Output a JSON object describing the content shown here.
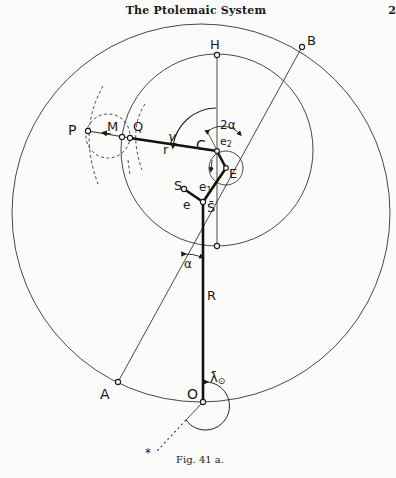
{
  "header": {
    "title": "The Ptolemaic System",
    "page_number": "2"
  },
  "figure": {
    "caption": "Fig. 41 a.",
    "points": {
      "P": "P",
      "M": "M",
      "Q": "Q",
      "H": "H",
      "B": "B",
      "C": "C",
      "E": "E",
      "S": "S",
      "S_bar": "S̄",
      "A": "A",
      "O": "O",
      "star": "*"
    },
    "segments": {
      "r": "r",
      "R": "R",
      "e": "e",
      "e1": "e",
      "e1_sub": "1",
      "e2": "e",
      "e2_sub": "2"
    },
    "angles": {
      "gamma": "γ",
      "two_alpha": "2α",
      "alpha": "α",
      "lambda_sun": "λ̄",
      "lambda_sun_sub": "⊙"
    }
  }
}
